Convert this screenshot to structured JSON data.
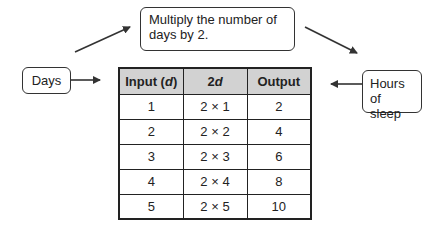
{
  "callouts": {
    "rule": {
      "line1": "Multiply the number of",
      "line2": "days by 2."
    },
    "input_label": "Days",
    "output_label": {
      "line1": "Hours",
      "line2": "of sleep"
    }
  },
  "table": {
    "headers": {
      "input_prefix": "Input (",
      "input_var": "d",
      "input_suffix": ")",
      "rule_coef": "2",
      "rule_var": "d",
      "output": "Output"
    },
    "rows": [
      {
        "input": "1",
        "expression": "2 × 1",
        "output": "2"
      },
      {
        "input": "2",
        "expression": "2 × 2",
        "output": "4"
      },
      {
        "input": "3",
        "expression": "2 × 3",
        "output": "6"
      },
      {
        "input": "4",
        "expression": "2 × 4",
        "output": "8"
      },
      {
        "input": "5",
        "expression": "2 × 5",
        "output": "10"
      }
    ]
  },
  "colors": {
    "header_bg": "#d2d2d2",
    "border": "#222222",
    "arrow": "#333333"
  }
}
